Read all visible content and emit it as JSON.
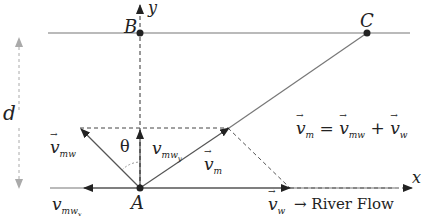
{
  "diagram": {
    "points": {
      "A": {
        "label": "A",
        "x": 140,
        "y": 188
      },
      "B": {
        "label": "B",
        "x": 140,
        "y": 33
      },
      "C": {
        "label": "C",
        "x": 367,
        "y": 33
      }
    },
    "axes": {
      "x_label": "x",
      "y_label": "y"
    },
    "distance_label": "d",
    "angle_label": "θ",
    "vectors": {
      "v_mw": {
        "base": "v",
        "sub": "mw"
      },
      "v_mw_y": {
        "base": "v",
        "sub": "mw",
        "subsub": "y"
      },
      "v_mw_x": {
        "base": "v",
        "sub": "mw",
        "subsub": "x"
      },
      "v_m": {
        "base": "v",
        "sub": "m"
      },
      "v_w": {
        "base": "v",
        "sub": "w"
      }
    },
    "equation": {
      "lhs": "v",
      "lhs_sub": "m",
      "eq": "=",
      "t1": "v",
      "t1_sub": "mw",
      "plus": "+",
      "t2": "v",
      "t2_sub": "w"
    },
    "river_flow_label": "→ River Flow",
    "colors": {
      "line": "#777777",
      "dark": "#222222",
      "dim": "#aaaaaa"
    }
  }
}
